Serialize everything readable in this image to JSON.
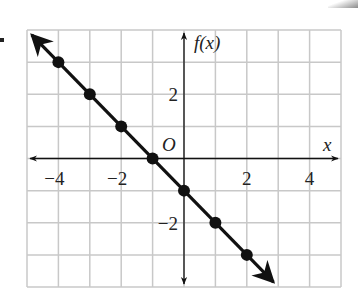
{
  "chart_data": {
    "type": "line",
    "title": "",
    "xlabel": "x",
    "ylabel": "f(x)",
    "origin_label": "O",
    "xlim": [
      -5,
      5
    ],
    "ylim": [
      -4,
      4
    ],
    "grid": true,
    "x_ticks": [
      {
        "value": -4,
        "label": "−4"
      },
      {
        "value": -2,
        "label": "−2"
      },
      {
        "value": 2,
        "label": "2"
      },
      {
        "value": 4,
        "label": "4"
      }
    ],
    "y_ticks": [
      {
        "value": 2,
        "label": "2"
      },
      {
        "value": -2,
        "label": "−2"
      }
    ],
    "series": [
      {
        "name": "f(x) = -x - 1",
        "x": [
          -4,
          -3,
          -2,
          -1,
          0,
          1,
          2
        ],
        "y": [
          3,
          2,
          1,
          0,
          -1,
          -2,
          -3
        ],
        "arrows_both_ends": true
      }
    ],
    "colors": {
      "grid": "#c8c8c8",
      "axis": "#111111",
      "line": "#111111"
    }
  }
}
